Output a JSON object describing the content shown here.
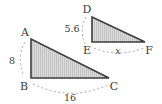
{
  "figure": {
    "caption": "Two similar right triangles with labeled side measures",
    "background_color": "#ffffff",
    "edge_color": "#3d3d3d",
    "fill_color": "#d9d9d9",
    "hatch_color": "#bdbdbd",
    "dimension_line_color": "#9a9a9a",
    "text_color": "#3a3a3a",
    "triangles": [
      {
        "name": "triangle-abc",
        "vertices": [
          {
            "label": "A",
            "x": 31,
            "y": 39,
            "label_x": 25,
            "label_y": 36
          },
          {
            "label": "B",
            "x": 31,
            "y": 78,
            "label_x": 24,
            "label_y": 90
          },
          {
            "label": "C",
            "x": 109,
            "y": 78,
            "label_x": 112,
            "label_y": 90
          }
        ],
        "measures": [
          {
            "name": "ab-length",
            "value": "8",
            "x": 17,
            "y": 62
          },
          {
            "name": "bc-length",
            "value": "16",
            "x": 70,
            "y": 100
          }
        ]
      },
      {
        "name": "triangle-def",
        "vertices": [
          {
            "label": "D",
            "x": 92,
            "y": 17,
            "label_x": 87,
            "label_y": 13
          },
          {
            "label": "E",
            "x": 92,
            "y": 42,
            "label_x": 86,
            "label_y": 54
          },
          {
            "label": "F",
            "x": 145,
            "y": 42,
            "label_x": 147,
            "label_y": 54
          }
        ],
        "measures": [
          {
            "name": "de-length",
            "value": "5.6",
            "x": 71,
            "y": 31
          },
          {
            "name": "ef-length",
            "value": "x",
            "x": 117,
            "y": 53
          }
        ]
      }
    ]
  }
}
